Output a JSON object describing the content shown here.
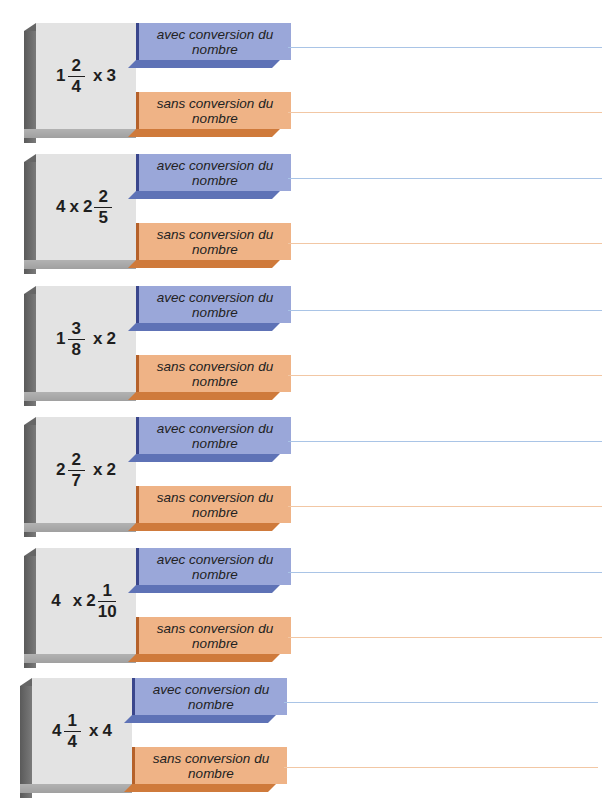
{
  "labels": {
    "avec": "avec conversion du nombre",
    "sans": "sans conversion du nombre"
  },
  "colors": {
    "avec_bar": "#9aa7d9",
    "sans_bar": "#efb386",
    "avec_line": "#a9c4e6",
    "sans_line": "#f2c7a4",
    "box_face": "#e3e3e3"
  },
  "exercises": [
    {
      "whole": "1",
      "num": "2",
      "den": "4",
      "op": "x",
      "factor": "3",
      "order": "mixed-first",
      "expression": "1 2/4 x 3"
    },
    {
      "whole": "2",
      "num": "2",
      "den": "5",
      "op": "x",
      "factor": "4",
      "order": "factor-first",
      "expression": "4 x 2 2/5"
    },
    {
      "whole": "1",
      "num": "3",
      "den": "8",
      "op": "x",
      "factor": "2",
      "order": "mixed-first",
      "expression": "1 3/8 x 2"
    },
    {
      "whole": "2",
      "num": "2",
      "den": "7",
      "op": "x",
      "factor": "2",
      "order": "mixed-first",
      "expression": "2 2/7 x 2"
    },
    {
      "whole": "2",
      "num": "1",
      "den": "10",
      "op": "x",
      "factor": "4",
      "order": "factor-first",
      "expression": "4 x 2 1/10"
    },
    {
      "whole": "4",
      "num": "1",
      "den": "4",
      "op": "x",
      "factor": "4",
      "order": "mixed-first",
      "expression": "4 1/4 x 4"
    }
  ]
}
